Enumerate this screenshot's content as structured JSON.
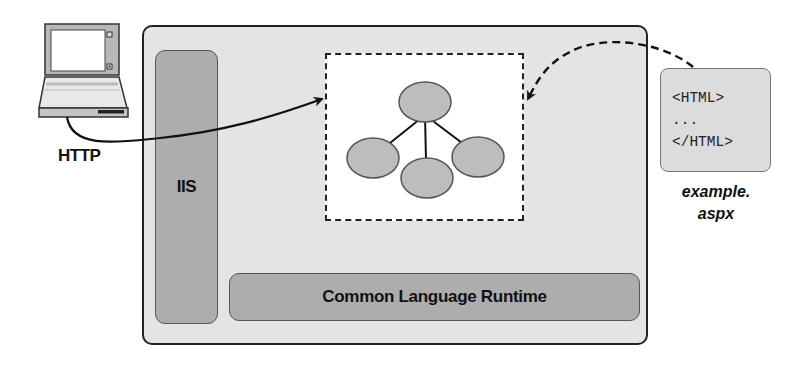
{
  "diagram": {
    "client": {
      "icon": "laptop-icon",
      "protocol_label": "HTTP"
    },
    "server": {
      "iis_label": "IIS",
      "runtime_label": "Common Language Runtime",
      "page_object_tree": {
        "icon": "object-tree-icon",
        "nodes": 4
      }
    },
    "source_file": {
      "lines": [
        "<HTML>",
        "...",
        "</HTML>"
      ],
      "name_line1": "example.",
      "name_line2": "aspx"
    },
    "colors": {
      "server_fill": "#e4e4e4",
      "component_fill": "#adadad",
      "node_fill": "#bdbdbd",
      "stroke": "#222222"
    }
  }
}
